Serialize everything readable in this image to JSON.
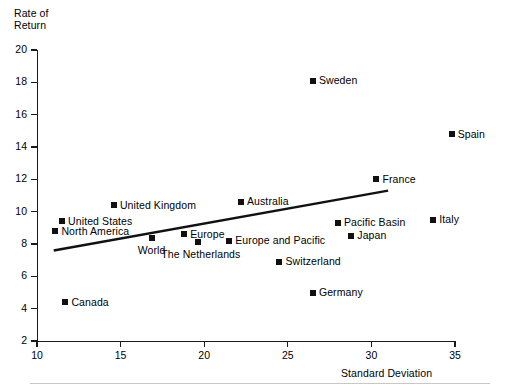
{
  "chart_data": {
    "type": "scatter",
    "title": "",
    "xlabel": "Standard Deviation",
    "ylabel": "Rate of Return",
    "ylabel_line1": "Rate of",
    "ylabel_line2": "Return",
    "xlim": [
      10,
      35
    ],
    "ylim": [
      2,
      20
    ],
    "xticks": [
      10,
      15,
      20,
      25,
      30,
      35
    ],
    "yticks": [
      2,
      4,
      6,
      8,
      10,
      12,
      14,
      16,
      18,
      20
    ],
    "grid": false,
    "legend": "none",
    "points": [
      {
        "label": "Canada",
        "x": 11.7,
        "y": 4.4,
        "label_pos": "right"
      },
      {
        "label": "North America",
        "x": 11.1,
        "y": 8.8,
        "label_pos": "right"
      },
      {
        "label": "United States",
        "x": 11.5,
        "y": 9.4,
        "label_pos": "right"
      },
      {
        "label": "United Kingdom",
        "x": 14.6,
        "y": 10.4,
        "label_pos": "right"
      },
      {
        "label": "World",
        "x": 16.9,
        "y": 8.4,
        "label_pos": "below"
      },
      {
        "label": "Europe",
        "x": 18.8,
        "y": 8.6,
        "label_pos": "right"
      },
      {
        "label": "The Netherlands",
        "x": 19.6,
        "y": 8.1,
        "label_pos": "below"
      },
      {
        "label": "Australia",
        "x": 22.2,
        "y": 10.6,
        "label_pos": "right"
      },
      {
        "label": "Europe and Pacific",
        "x": 21.5,
        "y": 8.2,
        "label_pos": "right"
      },
      {
        "label": "Switzerland",
        "x": 24.5,
        "y": 6.9,
        "label_pos": "right"
      },
      {
        "label": "Sweden",
        "x": 26.5,
        "y": 18.1,
        "label_pos": "right"
      },
      {
        "label": "Germany",
        "x": 26.5,
        "y": 5.0,
        "label_pos": "right"
      },
      {
        "label": "Pacific Basin",
        "x": 28.0,
        "y": 9.3,
        "label_pos": "right"
      },
      {
        "label": "Japan",
        "x": 28.8,
        "y": 8.5,
        "label_pos": "right"
      },
      {
        "label": "France",
        "x": 30.3,
        "y": 12.0,
        "label_pos": "right"
      },
      {
        "label": "Italy",
        "x": 33.7,
        "y": 9.5,
        "label_pos": "right"
      },
      {
        "label": "Spain",
        "x": 34.8,
        "y": 14.8,
        "label_pos": "right"
      }
    ],
    "trendline": {
      "type": "linear-fit",
      "x_start": 11.0,
      "y_start": 7.6,
      "x_end": 31.0,
      "y_end": 11.3
    }
  }
}
